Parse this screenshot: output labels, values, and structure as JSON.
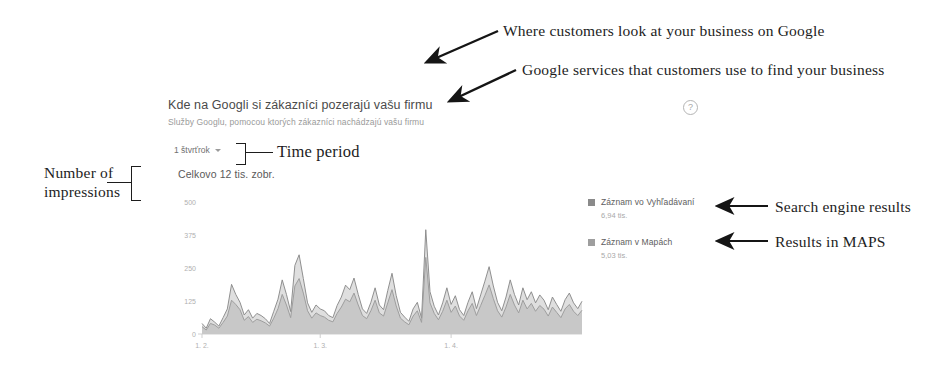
{
  "card": {
    "title": "Kde na Googli si zákazníci pozerajú vašu firmu",
    "subtitle": "Služby Googlu, pomocou ktorých zákazníci nachádzajú vašu firmu",
    "help_icon": "?",
    "period_value": "1 štvrťrok",
    "period_chevron": "chevron-down-icon",
    "total_impressions": "Celkovo 12 tis. zobr."
  },
  "legend": {
    "items": [
      {
        "label": "Záznam vo Vyhľadávaní",
        "value": "6,94 tis.",
        "color": "#8a8a8a"
      },
      {
        "label": "Záznam v Mapách",
        "value": "5,03 tis.",
        "color": "#9e9e9e"
      }
    ]
  },
  "annotations": {
    "top_1": "Where customers look at your business on Google",
    "top_2": "Google services that customers use to find your business",
    "time_period": "Time period",
    "number_of_impressions": "Number of impressions",
    "right_1": "Search engine results",
    "right_2": "Results in MAPS"
  },
  "chart_data": {
    "type": "area",
    "title": "Kde na Googli si zákazníci pozerajú vašu firmu",
    "subtitle": "Služby Googlu, pomocou ktorých zákazníci nachádzajú vašu firmu",
    "xlabel": "",
    "ylabel": "",
    "ylim": [
      0,
      500
    ],
    "yticks": [
      0,
      125,
      250,
      375,
      500
    ],
    "ytick_labels": [
      "0",
      "125",
      "250",
      "375",
      "500"
    ],
    "xtick_positions": [
      0,
      28,
      59
    ],
    "xtick_labels": [
      "1. 2.",
      "1. 3.",
      "1. 4."
    ],
    "grid": false,
    "legend_position": "right",
    "total_label": "Celkovo 12 tis. zobr.",
    "period": "1 štvrťrok",
    "series": [
      {
        "name": "Záznam vo Vyhľadávaní",
        "total": "6,94 tis.",
        "color": "#8a8a8a",
        "values": [
          40,
          22,
          58,
          45,
          30,
          62,
          95,
          188,
          150,
          120,
          72,
          92,
          60,
          78,
          70,
          58,
          40,
          86,
          132,
          205,
          150,
          85,
          260,
          300,
          210,
          118,
          82,
          110,
          95,
          88,
          70,
          62,
          108,
          140,
          185,
          168,
          212,
          150,
          95,
          78,
          120,
          175,
          110,
          92,
          165,
          230,
          145,
          82,
          64,
          48,
          95,
          120,
          60,
          395,
          160,
          105,
          72,
          118,
          175,
          112,
          145,
          92,
          70,
          120,
          160,
          96,
          148,
          200,
          255,
          182,
          120,
          88,
          140,
          205,
          150,
          110,
          175,
          130,
          160,
          118,
          148,
          128,
          92,
          140,
          112,
          86,
          130,
          155,
          118,
          96,
          124
        ]
      },
      {
        "name": "Záznam v Mapách",
        "total": "5,03 tis.",
        "color": "#9e9e9e",
        "values": [
          28,
          15,
          40,
          34,
          22,
          44,
          68,
          128,
          112,
          92,
          52,
          66,
          44,
          56,
          50,
          42,
          30,
          60,
          96,
          150,
          110,
          62,
          182,
          210,
          155,
          88,
          60,
          80,
          70,
          64,
          52,
          46,
          78,
          102,
          132,
          122,
          155,
          110,
          70,
          58,
          88,
          128,
          80,
          68,
          118,
          168,
          106,
          60,
          46,
          35,
          68,
          88,
          44,
          290,
          118,
          78,
          54,
          86,
          128,
          82,
          106,
          68,
          52,
          88,
          116,
          70,
          108,
          146,
          186,
          134,
          88,
          64,
          102,
          150,
          110,
          80,
          128,
          95,
          116,
          86,
          108,
          94,
          68,
          102,
          82,
          62,
          95,
          112,
          86,
          70,
          90
        ]
      }
    ]
  }
}
